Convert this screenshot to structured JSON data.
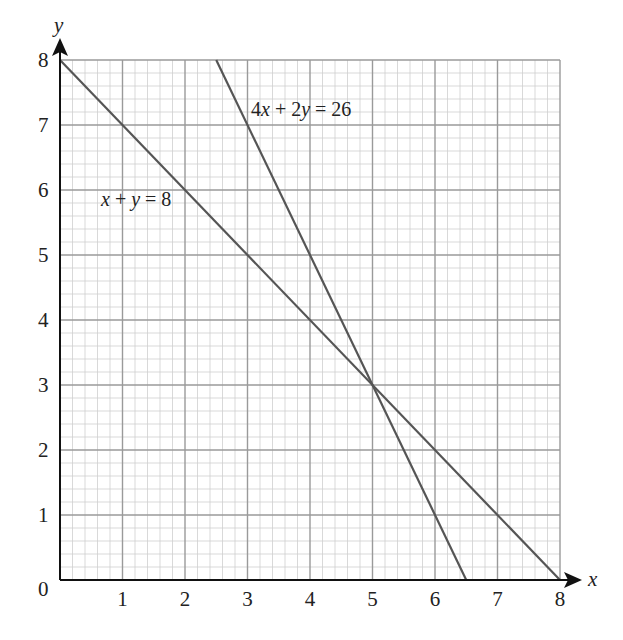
{
  "chart_data": {
    "type": "line",
    "title": "",
    "xlabel": "x",
    "ylabel": "y",
    "xlim": [
      0,
      8
    ],
    "ylim": [
      0,
      8
    ],
    "grid": true,
    "grid_minor_per_unit": 5,
    "x_ticks": [
      "1",
      "2",
      "3",
      "4",
      "5",
      "6",
      "7",
      "8"
    ],
    "y_ticks": [
      "1",
      "2",
      "3",
      "4",
      "5",
      "6",
      "7",
      "8"
    ],
    "origin_label": "0",
    "series": [
      {
        "name": "x + y = 8",
        "label_italic_parts": "x + y = 8",
        "equation": "x + y = 8",
        "points": [
          [
            0,
            8
          ],
          [
            8,
            0
          ]
        ]
      },
      {
        "name": "4x + 2y = 26",
        "equation": "4x + 2y = 26",
        "points": [
          [
            2.5,
            8
          ],
          [
            6.5,
            0
          ]
        ]
      }
    ],
    "annotations": [
      {
        "text": "x + y = 8",
        "x": 0.65,
        "y": 5.7
      },
      {
        "text": "4x + 2y = 26",
        "x": 3.05,
        "y": 7.1
      }
    ],
    "intersection": [
      5,
      3
    ]
  },
  "labels": {
    "x_axis": "x",
    "y_axis": "y",
    "origin": "0",
    "line1": {
      "a": "x",
      "op1": " + ",
      "b": "y",
      "rest": " = 8"
    },
    "line2": {
      "c1": "4",
      "a": "x",
      "op1": " + 2",
      "b": "y",
      "rest": " = 26"
    }
  },
  "colors": {
    "line": "#555555",
    "grid_major": "#9a9a9a",
    "grid_minor": "#cfcfcf",
    "axis": "#111111"
  }
}
